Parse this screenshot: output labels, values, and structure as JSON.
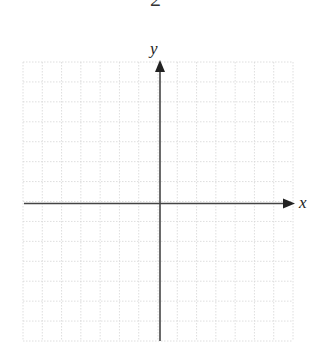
{
  "header": {
    "page_fragment": "2"
  },
  "diagram": {
    "type": "coordinate-plane",
    "grid": {
      "columns": 14,
      "rows": 14,
      "line_color": "#dcdcdc",
      "style": "dotted"
    },
    "axes": {
      "x_label": "x",
      "y_label": "y",
      "color": "#444444"
    }
  }
}
